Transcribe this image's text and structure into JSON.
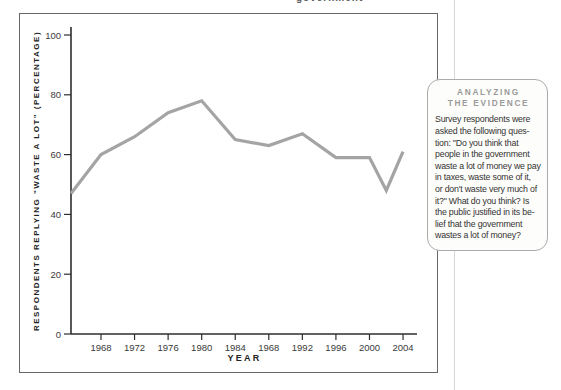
{
  "page": {
    "header_fragment": "government"
  },
  "chart_data": {
    "type": "line",
    "x": [
      1964,
      1968,
      1972,
      1976,
      1980,
      1984,
      1988,
      1992,
      1996,
      2000,
      2002,
      2004
    ],
    "values": [
      47,
      60,
      66,
      74,
      78,
      65,
      63,
      67,
      59,
      59,
      48,
      61
    ],
    "x_tick_years": [
      1968,
      1972,
      1976,
      1980,
      1984,
      1988,
      1992,
      1996,
      2000,
      2004
    ],
    "x_tick_labels": [
      "1968",
      "1972",
      "1976",
      "1980",
      "1984",
      "1968",
      "1992",
      "1996",
      "2000",
      "2004"
    ],
    "y_ticks": [
      0,
      20,
      40,
      60,
      80,
      100
    ],
    "ylim": [
      0,
      100
    ],
    "xlabel": "YEAR",
    "ylabel": "RESPONDENTS REPLYING \"WASTE A LOT\" (PERCENTAGE)",
    "line_color": "#a4a4a4",
    "axis_color": "#2e2e2e",
    "tick_label_color": "#3a3a3a",
    "legend": "none",
    "grid": "off"
  },
  "evidence_box": {
    "header_lines": [
      "ANALYZING",
      "THE EVIDENCE"
    ],
    "body_lines": [
      "Survey respondents were",
      "asked the following ques-",
      "tion: \"Do you think that",
      "people in the government",
      "waste a lot of money we pay",
      "in taxes, waste some of it,",
      "or don't waste very much of",
      "it?\" What do you think? Is",
      "the public justified in its be-",
      "lief that the government",
      "wastes a lot of money?"
    ]
  }
}
